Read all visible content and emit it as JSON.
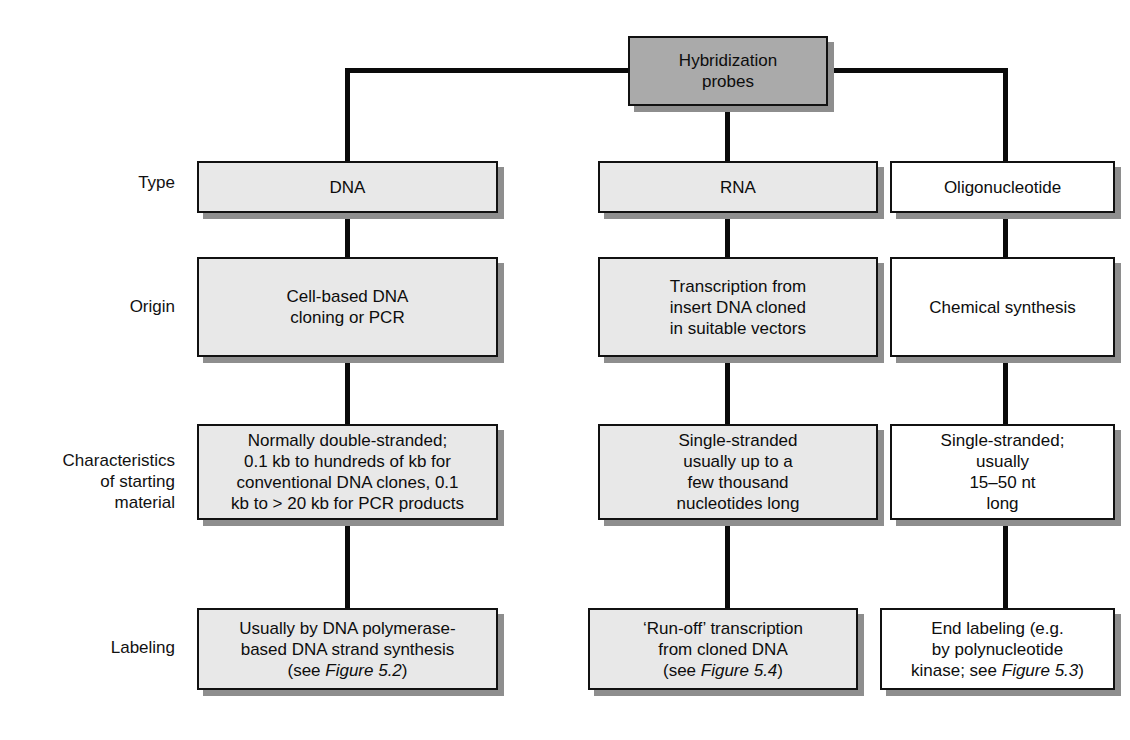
{
  "diagram": {
    "title": "Hybridization probes",
    "root": {
      "label": "Hybridization\nprobes"
    },
    "row_labels": [
      "Type",
      "Origin",
      "Characteristics\nof starting\nmaterial",
      "Labeling"
    ],
    "columns": [
      {
        "id": "dna",
        "type": "DNA",
        "origin": "Cell-based DNA\ncloning or PCR",
        "characteristics": "Normally double-stranded;\n0.1 kb to hundreds of kb for\nconventional DNA clones, 0.1\nkb to > 20 kb for PCR products",
        "labeling_pre": "Usually by DNA polymerase-\nbased DNA strand synthesis\n(see ",
        "labeling_italic": "Figure 5.2",
        "labeling_post": ")",
        "fill": "#e8e8e8"
      },
      {
        "id": "rna",
        "type": "RNA",
        "origin": "Transcription from\ninsert DNA cloned\nin suitable vectors",
        "characteristics": "Single-stranded\nusually up to a\nfew thousand\nnucleotides long",
        "labeling_pre": "‘Run-off’ transcription\nfrom cloned DNA\n(see ",
        "labeling_italic": "Figure 5.4",
        "labeling_post": ")",
        "fill": "#e8e8e8"
      },
      {
        "id": "oligonucleotide",
        "type": "Oligonucleotide",
        "origin": "Chemical synthesis",
        "characteristics": "Single-stranded;\nusually\n15–50 nt\nlong",
        "labeling_pre": "End labeling (e.g.\nby polynucleotide\nkinase; see ",
        "labeling_italic": "Figure 5.3",
        "labeling_post": ")",
        "fill": "#ffffff"
      }
    ],
    "colors": {
      "root_fill": "#aaaaaa",
      "gray_fill": "#e8e8e8",
      "white_fill": "#ffffff",
      "shadow": "#8e8e8e",
      "line": "#0a0a0a",
      "border": "#111111",
      "text": "#0d0d0d"
    }
  }
}
